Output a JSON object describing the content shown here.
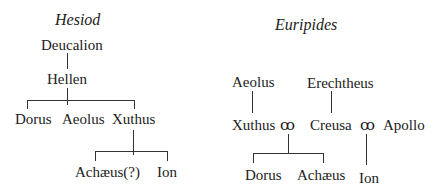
{
  "hesiod": {
    "title": "Hesiod",
    "deucalion": "Deucalion",
    "hellen": "Hellen",
    "dorus": "Dorus",
    "aeolus": "Aeolus",
    "xuthus": "Xuthus",
    "achaeus": "Achæus(?)",
    "ion": "Ion"
  },
  "euripides": {
    "title": "Euripides",
    "aeolus": "Aeolus",
    "erechtheus": "Erechtheus",
    "xuthus": "Xuthus",
    "marriage1": "ꝏ",
    "creusa": "Creusa",
    "marriage2": "ꝏ",
    "apollo": "Apollo",
    "dorus": "Dorus",
    "achaeus": "Achæus",
    "ion": "Ion"
  }
}
